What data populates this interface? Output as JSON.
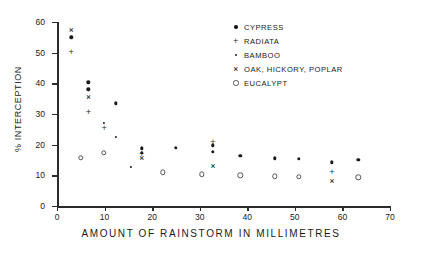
{
  "chart_data": {
    "type": "scatter",
    "title": "",
    "xlabel": "AMOUNT OF RAINSTORM IN MILLIMETRES",
    "ylabel": "% INTERCEPTION",
    "xlim": [
      0,
      70
    ],
    "ylim": [
      0,
      60
    ],
    "xticks": [
      0,
      10,
      20,
      30,
      40,
      50,
      60,
      70
    ],
    "yticks": [
      0,
      10,
      20,
      30,
      40,
      50,
      60
    ],
    "grid": false,
    "legend_position": "top-right",
    "series": [
      {
        "name": "CYPRESS",
        "marker": "dot",
        "points": [
          [
            3.0,
            55.0
          ],
          [
            6.6,
            40.3
          ],
          [
            6.6,
            38.0
          ],
          [
            12.3,
            33.5
          ],
          [
            17.8,
            18.8
          ],
          [
            17.8,
            17.4
          ],
          [
            25.0,
            19.0
          ],
          [
            32.8,
            19.8
          ],
          [
            32.8,
            17.6
          ],
          [
            38.5,
            16.3
          ],
          [
            45.8,
            15.6
          ],
          [
            50.8,
            15.4
          ],
          [
            57.8,
            14.2
          ],
          [
            63.3,
            15.0
          ]
        ]
      },
      {
        "name": "RADIATA",
        "marker": "plus",
        "points": [
          [
            3.0,
            50.2
          ],
          [
            6.6,
            30.8
          ],
          [
            9.9,
            25.3
          ],
          [
            17.8,
            17.0
          ],
          [
            32.8,
            21.0
          ],
          [
            57.8,
            11.2
          ]
        ]
      },
      {
        "name": "BAMBOO",
        "marker": "small-dot",
        "points": [
          [
            9.9,
            27.0
          ],
          [
            12.3,
            22.4
          ],
          [
            15.5,
            12.8
          ]
        ]
      },
      {
        "name": "OAK, HICKORY, POPLAR",
        "marker": "cross",
        "points": [
          [
            3.0,
            57.3
          ],
          [
            6.6,
            35.6
          ],
          [
            17.8,
            15.5
          ],
          [
            32.8,
            13.0
          ],
          [
            57.8,
            8.0
          ]
        ]
      },
      {
        "name": "EUCALYPT",
        "marker": "circle",
        "points": [
          [
            5.0,
            15.8
          ],
          [
            9.9,
            17.3
          ],
          [
            22.2,
            11.0
          ],
          [
            30.5,
            10.3
          ],
          [
            38.5,
            10.0
          ],
          [
            45.8,
            9.7
          ],
          [
            50.8,
            9.6
          ],
          [
            63.3,
            9.4
          ]
        ]
      }
    ]
  },
  "legend": {
    "items": [
      {
        "label": "CYPRESS",
        "marker": "dot"
      },
      {
        "label": "RADIATA",
        "marker": "plus"
      },
      {
        "label": "BAMBOO",
        "marker": "small-dot"
      },
      {
        "label": "OAK,  HICKORY,  POPLAR",
        "marker": "cross"
      },
      {
        "label": "EUCALYPT",
        "marker": "circle"
      }
    ]
  },
  "glyphs": {
    "plus": "+",
    "cross": "×"
  }
}
